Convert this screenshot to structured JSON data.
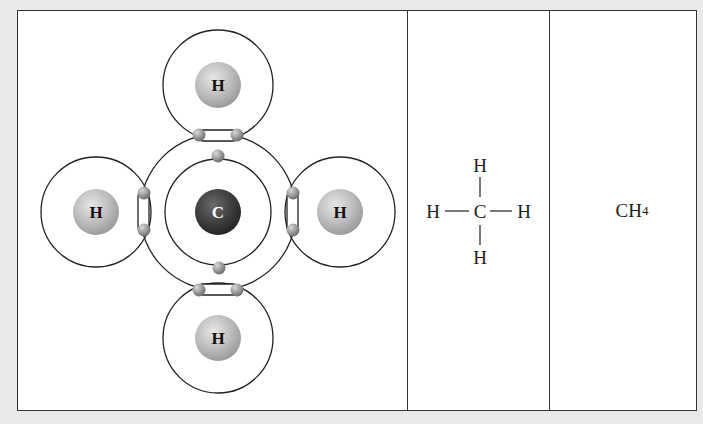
{
  "diagram": {
    "panels": [
      {
        "id": "electron-shell",
        "label": "Electron shell diagram"
      },
      {
        "id": "structural",
        "label": "Structural formula"
      },
      {
        "id": "molecular",
        "label": "Molecular formula"
      }
    ],
    "shell_diagram": {
      "central_atom": {
        "symbol": "C",
        "color": "#3a3a3a",
        "cx": 218,
        "cy": 212
      },
      "hydrogens": [
        {
          "symbol": "H",
          "position": "top",
          "cx": 218,
          "cy": 85
        },
        {
          "symbol": "H",
          "position": "left",
          "cx": 96,
          "cy": 212
        },
        {
          "symbol": "H",
          "position": "right",
          "cx": 340,
          "cy": 212
        },
        {
          "symbol": "H",
          "position": "bottom",
          "cx": 218,
          "cy": 338
        }
      ],
      "hydrogen_color": "#b8b8b8",
      "electron_color": "#9a9a9a",
      "inner_shell_electrons": 2,
      "shared_electron_pairs": 4
    },
    "structural_formula": {
      "center": "C",
      "top": "H",
      "left": "H",
      "right": "H",
      "bottom": "H"
    },
    "molecular_formula": {
      "base": "CH",
      "subscript": "4"
    }
  }
}
